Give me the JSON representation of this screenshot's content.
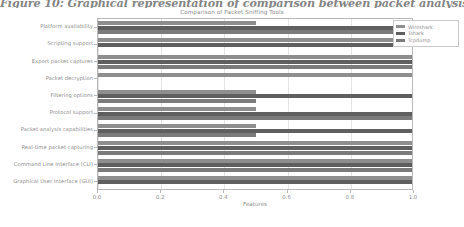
{
  "caption": {
    "text": "Figure 10: Graphical representation of comparison between packet analysis tool"
  },
  "figure": {
    "title": "Comparison of Packet Sniffing Tools",
    "xlabel": "Features",
    "legend": {
      "entries": [
        {
          "label": "Wireshark",
          "color": "#8e8e8e"
        },
        {
          "label": "Tshark",
          "color": "#5f5f5f"
        },
        {
          "label": "Tcpdump",
          "color": "#7b7b7b"
        }
      ]
    },
    "xticks": [
      "0.0",
      "0.2",
      "0.4",
      "0.6",
      "0.8",
      "1.0"
    ]
  },
  "chart_data": {
    "type": "bar",
    "orientation": "horizontal",
    "title": "Comparison of Packet Sniffing Tools",
    "xlabel": "Features",
    "ylabel": "",
    "xlim": [
      0.0,
      1.0
    ],
    "grid": true,
    "legend_position": "upper right",
    "categories": [
      "Platform availability",
      "Scripting support",
      "Export packet captures",
      "Packet decryption",
      "Filtering options",
      "Protocol support",
      "Packet analysis capabilities",
      "Real-time packet capturing",
      "Command Line Interface (CLI)",
      "Graphical User Interface (GUI)"
    ],
    "series": [
      {
        "name": "Wireshark",
        "color": "#8e8e8e",
        "values": [
          0.5,
          1.0,
          1.0,
          1.0,
          0.5,
          0.5,
          0.5,
          1.0,
          1.0,
          1.0
        ]
      },
      {
        "name": "Tshark",
        "color": "#5f5f5f",
        "values": [
          1.0,
          1.0,
          1.0,
          0.0,
          1.0,
          1.0,
          1.0,
          1.0,
          1.0,
          1.0
        ]
      },
      {
        "name": "Tcpdump",
        "color": "#7b7b7b",
        "values": [
          1.0,
          0.0,
          1.0,
          0.0,
          0.5,
          1.0,
          0.5,
          1.0,
          1.0,
          0.0
        ]
      }
    ]
  }
}
